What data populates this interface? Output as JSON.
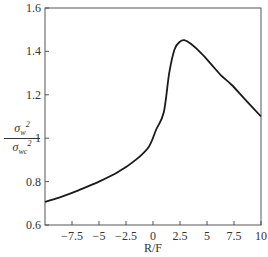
{
  "chart_data": {
    "type": "line",
    "title": "",
    "xlabel": "R/F",
    "ylabel": "σ_w^2 / σ_wc^2",
    "ylabel_parts": {
      "num_base": "σ",
      "num_sub": "w",
      "num_sup": "2",
      "den_base": "σ",
      "den_sub": "wc",
      "den_sup": "2"
    },
    "xlim": [
      -10,
      10
    ],
    "ylim": [
      0.6,
      1.6
    ],
    "grid": false,
    "legend": null,
    "x_ticks": [
      -7.5,
      -5,
      -2.5,
      0,
      2.5,
      5,
      7.5,
      10
    ],
    "x_tick_labels": [
      "−7.5",
      "−5",
      "−2.5",
      "0",
      "2.5",
      "5",
      "7.5",
      "10"
    ],
    "y_ticks": [
      0.6,
      0.8,
      1,
      1.2,
      1.4,
      1.6
    ],
    "y_tick_labels": [
      "0.6",
      "0.8",
      "1",
      "1.2",
      "1.4",
      "1.6"
    ],
    "series": [
      {
        "name": "σw²/σwc²",
        "color": "#1a1a1a",
        "x": [
          -10,
          -8.5,
          -6.9,
          -5.0,
          -3.2,
          -1.6,
          -0.4,
          0.3,
          1.0,
          1.5,
          2.0,
          2.5,
          2.9,
          3.5,
          4.5,
          5.4,
          6.3,
          7.3,
          8.5,
          10
        ],
        "y": [
          0.706,
          0.73,
          0.76,
          0.8,
          0.845,
          0.9,
          0.96,
          1.04,
          1.12,
          1.3,
          1.41,
          1.445,
          1.452,
          1.435,
          1.39,
          1.34,
          1.29,
          1.245,
          1.18,
          1.1
        ]
      }
    ]
  }
}
